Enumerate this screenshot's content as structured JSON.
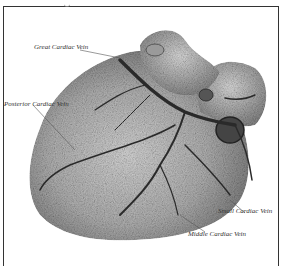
{
  "figure": {
    "labels": [
      {
        "id": "great",
        "text": "Great Cardiac Vein"
      },
      {
        "id": "posterior",
        "text": "Posterior Cardiac Vein"
      },
      {
        "id": "small",
        "text": "Small Cardiac Vein"
      },
      {
        "id": "middle",
        "text": "Middle Cardiac Vein"
      }
    ]
  },
  "colors": {
    "frame": "#333333",
    "tissue_light": "#cfcfcf",
    "tissue_dark": "#6a6a6a",
    "vein": "#2a2a2a"
  }
}
